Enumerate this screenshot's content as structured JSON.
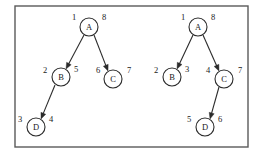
{
  "figure": {
    "frame": {
      "x": 15,
      "y": 6,
      "width": 233,
      "height": 141,
      "border_color": "#5a5a5a",
      "background": "#ffffff"
    },
    "ink_color": "#1a1a1a",
    "graphs": [
      {
        "name": "left-graph",
        "nodes": [
          {
            "id": "A",
            "label": "A",
            "cx": 89,
            "cy": 27,
            "r": 9,
            "discovery_time": "1",
            "finish_time": "8",
            "discovery_label_x": 74,
            "discovery_label_y": 17,
            "finish_label_x": 104,
            "finish_label_y": 17
          },
          {
            "id": "B",
            "label": "B",
            "cx": 61,
            "cy": 77,
            "r": 9,
            "discovery_time": "2",
            "finish_time": "5",
            "discovery_label_x": 45,
            "discovery_label_y": 70,
            "finish_label_x": 76,
            "finish_label_y": 69
          },
          {
            "id": "C",
            "label": "C",
            "cx": 113,
            "cy": 79,
            "r": 9,
            "discovery_time": "6",
            "finish_time": "7",
            "discovery_label_x": 98,
            "discovery_label_y": 70,
            "finish_label_x": 129,
            "finish_label_y": 70
          },
          {
            "id": "D",
            "label": "D",
            "cx": 36,
            "cy": 127,
            "r": 9,
            "discovery_time": "3",
            "finish_time": "4",
            "discovery_label_x": 20,
            "discovery_label_y": 119,
            "finish_label_x": 51,
            "finish_label_y": 119
          }
        ],
        "edges": [
          {
            "from": "A",
            "to": "B",
            "x1": 84,
            "y1": 35,
            "x2": 66,
            "y2": 69
          },
          {
            "from": "A",
            "to": "C",
            "x1": 94,
            "y1": 35,
            "x2": 108,
            "y2": 71
          },
          {
            "from": "B",
            "to": "D",
            "x1": 55,
            "y1": 85,
            "x2": 41,
            "y2": 119
          }
        ]
      },
      {
        "name": "right-graph",
        "nodes": [
          {
            "id": "A",
            "label": "A",
            "cx": 198,
            "cy": 27,
            "r": 9,
            "discovery_time": "1",
            "finish_time": "8",
            "discovery_label_x": 183,
            "discovery_label_y": 17,
            "finish_label_x": 213,
            "finish_label_y": 17
          },
          {
            "id": "B",
            "label": "B",
            "cx": 172,
            "cy": 77,
            "r": 9,
            "discovery_time": "2",
            "finish_time": "3",
            "discovery_label_x": 156,
            "discovery_label_y": 70,
            "finish_label_x": 187,
            "finish_label_y": 69
          },
          {
            "id": "C",
            "label": "C",
            "cx": 224,
            "cy": 79,
            "r": 9,
            "discovery_time": "4",
            "finish_time": "7",
            "discovery_label_x": 208,
            "discovery_label_y": 70,
            "finish_label_x": 240,
            "finish_label_y": 70
          },
          {
            "id": "D",
            "label": "D",
            "cx": 205,
            "cy": 127,
            "r": 9,
            "discovery_time": "5",
            "finish_time": "6",
            "discovery_label_x": 189,
            "discovery_label_y": 119,
            "finish_label_x": 220,
            "finish_label_y": 119
          }
        ],
        "edges": [
          {
            "from": "A",
            "to": "B",
            "x1": 193,
            "y1": 35,
            "x2": 177,
            "y2": 69
          },
          {
            "from": "A",
            "to": "C",
            "x1": 203,
            "y1": 35,
            "x2": 219,
            "y2": 71
          },
          {
            "from": "C",
            "to": "D",
            "x1": 219,
            "y1": 87,
            "x2": 210,
            "y2": 119
          }
        ]
      }
    ]
  }
}
